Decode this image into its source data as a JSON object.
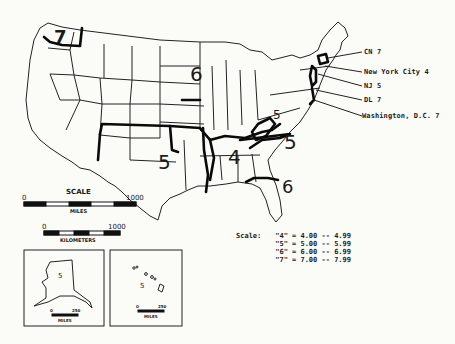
{
  "map": {
    "title": "",
    "region_labels": [
      {
        "region": "Washington",
        "value": "7"
      },
      {
        "region": "Upper Midwest",
        "value": "6"
      },
      {
        "region": "South Central",
        "value": "5"
      },
      {
        "region": "Deep South",
        "value": "4"
      },
      {
        "region": "Mid-Atlantic / Carolinas",
        "value": "5"
      },
      {
        "region": "West Virginia",
        "value": "5"
      },
      {
        "region": "Florida",
        "value": "6"
      }
    ],
    "callouts": [
      {
        "label": "CN 7"
      },
      {
        "label": "New York City 4"
      },
      {
        "label": "NJ 5"
      },
      {
        "label": "DL 7"
      },
      {
        "label": "Washington, D.C. 7"
      }
    ]
  },
  "scale": {
    "title": "SCALE",
    "miles": {
      "start": "0",
      "end": "1000",
      "unit": "MILES"
    },
    "kilometers": {
      "start": "0",
      "end": "1000",
      "unit": "KILOMETERS"
    }
  },
  "insets": [
    {
      "name": "Alaska",
      "value": "5",
      "scale_start": "0",
      "scale_end": "250",
      "unit": "MILES"
    },
    {
      "name": "Hawaii",
      "value": "5",
      "scale_start": "0",
      "scale_end": "250",
      "unit": "MILES"
    }
  ],
  "legend": {
    "title": "Scale:",
    "rows": [
      {
        "key": "\"4\"",
        "range": "= 4.00 -- 4.99"
      },
      {
        "key": "\"5\"",
        "range": "= 5.00 -- 5.99"
      },
      {
        "key": "\"6\"",
        "range": "= 6.00 -- 6.99"
      },
      {
        "key": "\"7\"",
        "range": "= 7.00 -- 7.99"
      }
    ]
  }
}
